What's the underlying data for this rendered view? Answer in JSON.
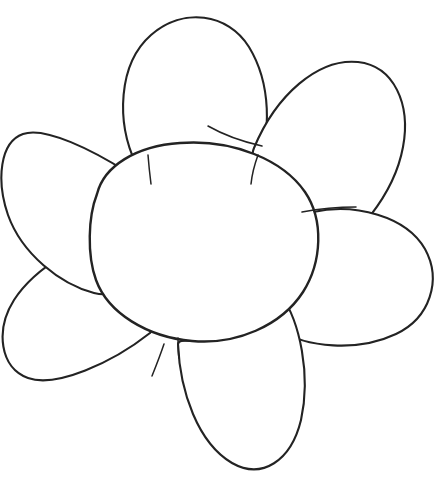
{
  "artwork": {
    "title": "Flower line drawing",
    "subject": "flower",
    "medium": "hand-drawn pencil and ink line art",
    "style": "uncolored outline / coloring-book line drawing",
    "background_color": "#ffffff",
    "stroke_color": "#232323",
    "fill_color": "#ffffff",
    "canvas": {
      "width": 446,
      "height": 483
    },
    "petal_count": 6,
    "has_text": false,
    "has_color_fill": false
  },
  "shapes": {
    "center": {
      "name": "flower-center",
      "label": "center disc",
      "cx": 208,
      "cy": 240,
      "rx": 113,
      "ry": 100,
      "stroke_weight": "heavy",
      "path": "M 97 194 C 104 166 136 146 180 143 C 233 139 283 160 305 192 C 324 220 322 262 303 292 C 281 326 236 345 192 341 C 147 337 108 313 96 280 C 87 255 88 217 97 194 Z"
    },
    "petals": [
      {
        "name": "petal-top",
        "label": "top petal",
        "position": "top",
        "angle_deg": 95,
        "tip": {
          "x": 190,
          "y": 20
        },
        "base": {
          "x": 150,
          "y": 163
        },
        "path": "M 136 164 C 116 122 118 64 151 35 C 183 7 228 13 249 47 C 271 83 272 134 256 170 C 246 192 238 195 231 190 C 215 179 196 172 175 170 C 157 168 144 174 136 164 Z"
      },
      {
        "name": "petal-upper-right",
        "label": "upper right petal",
        "position": "upper-right",
        "angle_deg": 40,
        "tip": {
          "x": 392,
          "y": 92
        },
        "base": {
          "x": 250,
          "y": 145
        },
        "path": "M 254 148 C 276 95 318 58 358 62 C 394 66 411 104 403 147 C 394 196 355 240 317 264 C 300 274 293 268 293 257 C 292 232 283 204 268 180 C 258 163 249 160 254 148 Z"
      },
      {
        "name": "petal-right",
        "label": "right petal",
        "position": "right",
        "angle_deg": -10,
        "tip": {
          "x": 430,
          "y": 268
        },
        "base": {
          "x": 310,
          "y": 212
        },
        "path": "M 313 212 C 355 203 406 216 425 249 C 442 280 430 318 396 334 C 358 352 306 348 278 329 C 262 318 263 310 272 306 C 292 296 306 276 313 252 C 317 234 311 220 313 212 Z"
      },
      {
        "name": "petal-bottom",
        "label": "bottom petal",
        "position": "bottom",
        "angle_deg": -80,
        "tip": {
          "x": 246,
          "y": 472
        },
        "base": {
          "x": 178,
          "y": 340
        },
        "path": "M 178 344 C 180 392 198 443 232 463 C 262 480 291 461 301 420 C 311 375 300 322 281 295 C 270 279 262 281 259 291 C 252 314 234 332 210 339 C 194 344 179 337 178 344 Z"
      },
      {
        "name": "petal-lower-left",
        "label": "lower left petal",
        "position": "lower-left",
        "angle_deg": -145,
        "tip": {
          "x": 8,
          "y": 378
        },
        "base": {
          "x": 150,
          "y": 330
        },
        "path": "M 150 333 C 112 363 56 388 28 378 C 0 368 -5 330 14 300 C 36 266 84 240 122 231 C 139 227 145 233 143 241 C 135 264 137 290 148 312 C 155 326 154 328 150 333 Z"
      },
      {
        "name": "petal-upper-left",
        "label": "upper left petal",
        "position": "upper-left",
        "angle_deg": 160,
        "tip": {
          "x": 6,
          "y": 180
        },
        "base": {
          "x": 126,
          "y": 172
        },
        "path": "M 127 172 C 94 151 45 126 23 134 C 0 142 -4 180 8 215 C 22 254 60 284 94 293 C 110 297 116 291 114 284 C 107 262 105 236 111 213 C 117 192 126 180 127 172 Z"
      }
    ],
    "stray_marks": [
      {
        "name": "stray-mark-top-junction",
        "label": "stray pencil stroke near top petal junction",
        "path": "M 208 126 C 222 134 244 142 262 146"
      },
      {
        "name": "stray-mark-top-petal-base",
        "label": "light line inside top petal base",
        "path": "M 148 155 C 149 168 150 176 151 184"
      },
      {
        "name": "stray-mark-right-junction",
        "label": "stray stroke near right petal junction",
        "path": "M 302 212 C 318 209 338 207 356 207"
      },
      {
        "name": "stray-mark-lower-left-junction",
        "label": "short stroke below lower-left junction",
        "path": "M 164 344 C 160 356 156 366 152 376"
      },
      {
        "name": "stray-mark-upper-right-base",
        "label": "faint line inside upper-right petal base",
        "path": "M 258 155 C 254 166 252 174 251 184"
      },
      {
        "name": "stray-mark-bottom-junction",
        "label": "short tick at bottom petal junction",
        "path": "M 178 338 C 178 347 178 353 179 358"
      }
    ]
  }
}
